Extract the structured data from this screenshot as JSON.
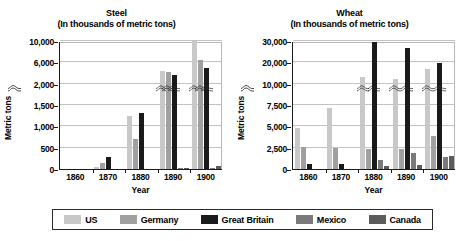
{
  "legend": {
    "items": [
      {
        "label": "US",
        "color": "#c8c8c8"
      },
      {
        "label": "Germany",
        "color": "#a0a0a0"
      },
      {
        "label": "Great Britain",
        "color": "#1a1a1a"
      },
      {
        "label": "Mexico",
        "color": "#7a7a7a"
      },
      {
        "label": "Canada",
        "color": "#5c5c5c"
      }
    ]
  },
  "chart_data": [
    {
      "type": "bar",
      "title": "Steel",
      "subtitle": "(In thousands of metric tons)",
      "xlabel": "Year",
      "ylabel": "Metric tons",
      "categories": [
        "1860",
        "1870",
        "1880",
        "1890",
        "1900"
      ],
      "yticks": [
        "0",
        "500",
        "1,000",
        "1,500",
        "2,000",
        "6,000",
        "10,000"
      ],
      "axis_break_after": "2,000",
      "ylim": [
        0,
        10000
      ],
      "grid": true,
      "legend_position": "bottom",
      "series": [
        {
          "name": "US",
          "color": "#c8c8c8",
          "values": [
            0,
            40,
            1250,
            4300,
            10200
          ]
        },
        {
          "name": "Germany",
          "color": "#a0a0a0",
          "values": [
            0,
            130,
            700,
            4100,
            6400
          ]
        },
        {
          "name": "Great Britain",
          "color": "#1a1a1a",
          "values": [
            0,
            290,
            1320,
            3600,
            5000
          ]
        },
        {
          "name": "Mexico",
          "color": "#7a7a7a",
          "values": [
            0,
            0,
            0,
            30,
            35
          ]
        },
        {
          "name": "Canada",
          "color": "#5c5c5c",
          "values": [
            0,
            0,
            0,
            25,
            60
          ]
        }
      ]
    },
    {
      "type": "bar",
      "title": "Wheat",
      "subtitle": "(In thousands of metric tons)",
      "xlabel": "Year",
      "ylabel": "Metric tons",
      "categories": [
        "1860",
        "1870",
        "1880",
        "1890",
        "1900"
      ],
      "yticks": [
        "0",
        "2,500",
        "5,000",
        "7,500",
        "10,000",
        "20,000",
        "30,000"
      ],
      "axis_break_after": "10,000",
      "ylim": [
        0,
        30000
      ],
      "grid": true,
      "legend_position": "bottom",
      "series": [
        {
          "name": "US",
          "color": "#c8c8c8",
          "values": [
            4800,
            7100,
            13000,
            12400,
            16800
          ]
        },
        {
          "name": "Germany",
          "color": "#a0a0a0",
          "values": [
            2600,
            2450,
            2350,
            2400,
            3900
          ]
        },
        {
          "name": "Great Britain",
          "color": "#1a1a1a",
          "values": [
            600,
            550,
            29500,
            26700,
            19600
          ]
        },
        {
          "name": "Mexico",
          "color": "#7a7a7a",
          "values": [
            0,
            0,
            1100,
            1900,
            1350
          ]
        },
        {
          "name": "Canada",
          "color": "#5c5c5c",
          "values": [
            0,
            0,
            350,
            450,
            1500
          ]
        }
      ]
    }
  ]
}
